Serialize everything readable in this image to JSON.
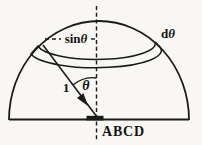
{
  "figure": {
    "labels": {
      "latitude_radius": {
        "prefix": "sin",
        "symbol": "θ"
      },
      "angle_increment": {
        "prefix": "d",
        "symbol": "θ"
      },
      "unit_radius": "1",
      "polar_angle": "θ",
      "base": "ABCD"
    },
    "colors": {
      "ink": "#1b1b1b",
      "band_fill": "#c9c9c9",
      "paper": "#f8f7f4"
    }
  }
}
